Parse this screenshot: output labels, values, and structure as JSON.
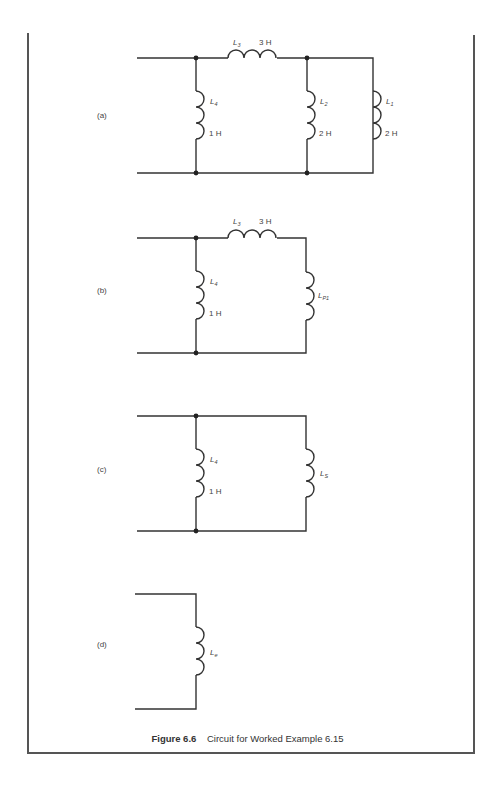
{
  "figure": {
    "number_label": "Figure 6.6",
    "caption": "Circuit for Worked Example 6.15"
  },
  "circuits": [
    {
      "part": "(a)",
      "components": [
        {
          "name": "L",
          "sub": "3",
          "value": "3 H",
          "orientation": "horizontal"
        },
        {
          "name": "L",
          "sub": "4",
          "value": "1 H",
          "orientation": "vertical"
        },
        {
          "name": "L",
          "sub": "2",
          "value": "2 H",
          "orientation": "vertical"
        },
        {
          "name": "L",
          "sub": "1",
          "value": "2 H",
          "orientation": "vertical"
        }
      ]
    },
    {
      "part": "(b)",
      "components": [
        {
          "name": "L",
          "sub": "3",
          "value": "3 H",
          "orientation": "horizontal"
        },
        {
          "name": "L",
          "sub": "4",
          "value": "1 H",
          "orientation": "vertical"
        },
        {
          "name": "L",
          "sub": "P1",
          "value": "",
          "orientation": "vertical"
        }
      ]
    },
    {
      "part": "(c)",
      "components": [
        {
          "name": "L",
          "sub": "4",
          "value": "1 H",
          "orientation": "vertical"
        },
        {
          "name": "L",
          "sub": "S",
          "value": "",
          "orientation": "vertical"
        }
      ]
    },
    {
      "part": "(d)",
      "components": [
        {
          "name": "L",
          "sub": "e",
          "value": "",
          "orientation": "vertical"
        }
      ]
    }
  ]
}
